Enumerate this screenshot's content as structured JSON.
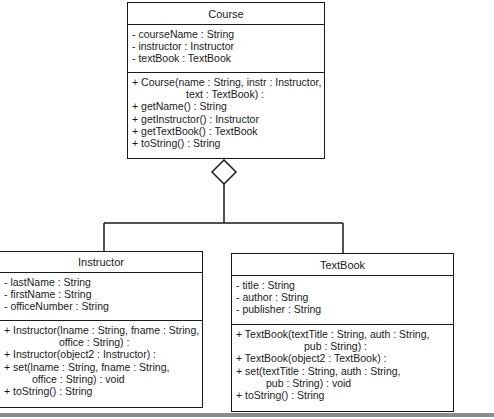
{
  "diagram": {
    "type": "UML class diagram (aggregation)",
    "relationship": "aggregation",
    "classes": {
      "course": {
        "name": "Course",
        "attributes": [
          "- courseName : String",
          "- instructor : Instructor",
          "- textBook : TextBook"
        ],
        "methods": [
          "+ Course(name : String, instr : Instructor,",
          "text : TextBook) :",
          "+ getName() : String",
          "+ getInstructor() : Instructor",
          "+ getTextBook() : TextBook",
          "+ toString() : String"
        ]
      },
      "instructor": {
        "name": "Instructor",
        "attributes": [
          "- lastName : String",
          "- firstName : String",
          "- officeNumber : String"
        ],
        "methods": [
          "+ Instructor(lname : String, fname : String,",
          "office : String) :",
          "+ Instructor(object2 : Instructor) :",
          "+ set(lname : String, fname : String,",
          "office : String) : void",
          "+ toString() : String"
        ]
      },
      "textbook": {
        "name": "TextBook",
        "attributes": [
          "- title : String",
          "- author : String",
          "- publisher : String"
        ],
        "methods": [
          "+ TextBook(textTitle : String, auth : String,",
          "pub : String) :",
          "+ TextBook(object2 : TextBook) :",
          "+ set(textTitle : String, auth : String,",
          "pub : String) : void",
          "+ toString() : String"
        ]
      }
    },
    "colors": {
      "stroke": "#1a1a1a",
      "background": "#ffffff",
      "bottom_bar": "#8a8a8a"
    }
  }
}
